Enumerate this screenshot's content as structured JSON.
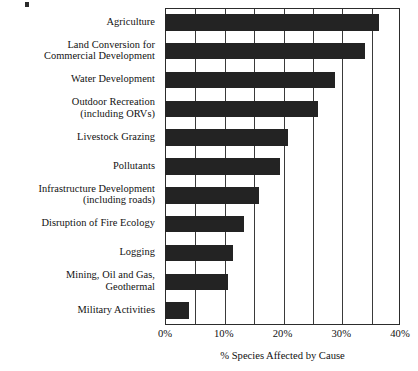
{
  "chart_data": {
    "type": "bar",
    "orientation": "horizontal",
    "title": "",
    "xlabel": "% Species Affected by Cause",
    "ylabel": "",
    "xlim": [
      0,
      40
    ],
    "xtick_labels": [
      "0%",
      "10%",
      "20%",
      "30%",
      "40%"
    ],
    "xtick_values": [
      0,
      10,
      20,
      30,
      40
    ],
    "grid": true,
    "gridline_values": [
      0,
      5,
      10,
      15,
      20,
      25,
      30,
      35,
      40
    ],
    "legend": "none",
    "bar_color": "#232323",
    "categories": [
      "Agriculture",
      "Land Conversion for\nCommercial Development",
      "Water Development",
      "Outdoor Recreation\n(including ORVs)",
      "Livestock Grazing",
      "Pollutants",
      "Infrastructure Development\n(including roads)",
      "Disruption of Fire Ecology",
      "Logging",
      "Mining, Oil and Gas,\nGeothermal",
      "Military Activities"
    ],
    "values": [
      36.5,
      34.0,
      29.0,
      26.0,
      21.0,
      19.5,
      16.0,
      13.5,
      11.5,
      10.7,
      4.0
    ]
  }
}
